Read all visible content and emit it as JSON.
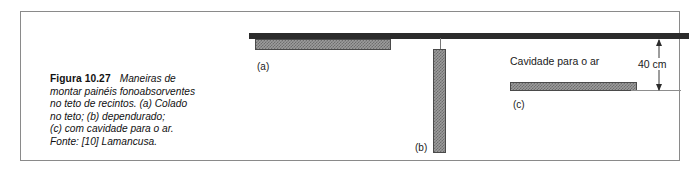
{
  "figure": {
    "caption": {
      "label": "Figura 10.27",
      "lines": [
        "Maneiras de",
        "montar painéis fonoabsorventes",
        "no teto de recintos. (a) Colado",
        "no teto; (b) dependurado;",
        "(c) com cavidade para o ar.",
        "Fonte: [10] Lamancusa."
      ]
    },
    "diagram": {
      "ceiling_name": "ceiling-slab",
      "panels": [
        {
          "key": "a",
          "label": "(a)",
          "description": "Colado no teto"
        },
        {
          "key": "b",
          "label": "(b)",
          "description": "Dependurado"
        },
        {
          "key": "c",
          "label": "(c)",
          "description": "Com cavidade para o ar"
        }
      ],
      "cavity_text": "Cavidade para o ar",
      "dimension": {
        "value": "40 cm"
      }
    },
    "colors": {
      "frame": "#8a8a8a",
      "ceiling": "#2b2b2b",
      "panel_fill": "#9c9c9c",
      "panel_hatch": "#6e6e6e",
      "panel_border": "#4a4a4a",
      "text": "#1a1a1a",
      "background": "#ffffff"
    }
  }
}
